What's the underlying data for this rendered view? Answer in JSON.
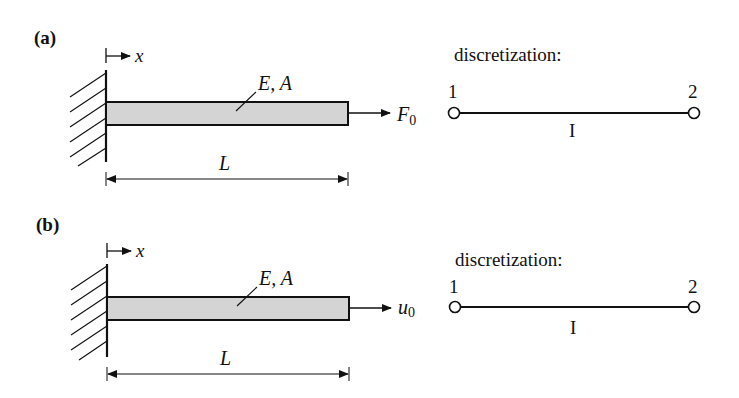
{
  "colors": {
    "ink": "#111111",
    "bar_fill": "#d4d4d4",
    "background": "#ffffff"
  },
  "panels": [
    {
      "label": "(a)",
      "axis_label": "x",
      "material_label": "E, A",
      "length_label": "L",
      "load_type": "force",
      "load_label": "F",
      "load_subscript": "0",
      "discretization": {
        "title": "discretization:",
        "node_1": "1",
        "node_2": "2",
        "element": "I"
      }
    },
    {
      "label": "(b)",
      "axis_label": "x",
      "material_label": "E, A",
      "length_label": "L",
      "load_type": "displacement",
      "load_label": "u",
      "load_subscript": "0",
      "discretization": {
        "title": "discretization:",
        "node_1": "1",
        "node_2": "2",
        "element": "I"
      }
    }
  ]
}
